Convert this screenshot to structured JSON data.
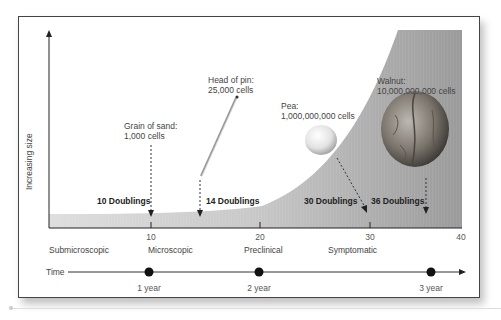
{
  "diagram": {
    "y_axis_label": "Increasing size",
    "x_ticks": [
      {
        "label": "10",
        "x": 151
      },
      {
        "label": "20",
        "x": 260
      },
      {
        "label": "30",
        "x": 370
      },
      {
        "label": "40",
        "x": 461
      }
    ],
    "stages": [
      "Submicroscopic",
      "Microscopic",
      "Preclinical",
      "Symptomatic"
    ],
    "doublings": [
      {
        "label": "10 Doublings"
      },
      {
        "label": "14 Doublings"
      },
      {
        "label": "30 Doublings"
      },
      {
        "label": "36 Doublings"
      }
    ],
    "annotations": [
      {
        "title": "Grain of sand:",
        "cells": "1,000 cells"
      },
      {
        "title": "Head of pin:",
        "cells": "25,000 cells"
      },
      {
        "title": "Pea:",
        "cells": "1,000,000,000 cells"
      },
      {
        "title": "Walnut:",
        "cells": "10,000,000,000 cells"
      }
    ],
    "timeline": {
      "label": "Time",
      "markers": [
        "1 year",
        "2 year",
        "3 year"
      ]
    },
    "colors": {
      "curve_fill": "#9a9a9a",
      "axis": "#222222",
      "frame": "#444444"
    }
  }
}
